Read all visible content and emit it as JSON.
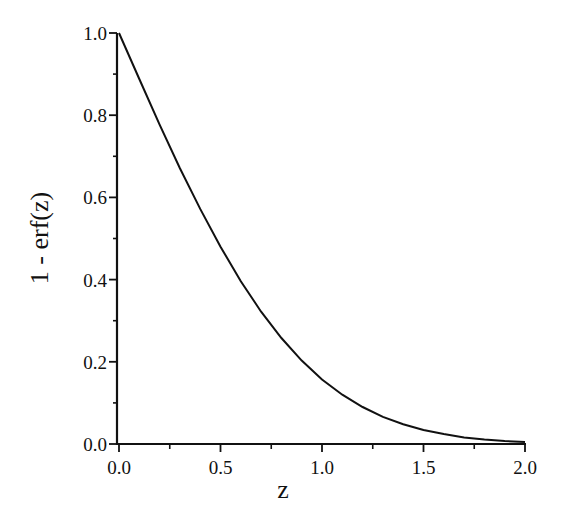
{
  "chart_data": {
    "type": "line",
    "title": "",
    "xlabel": "z",
    "ylabel": "1 - erf(z)",
    "xlim": [
      0.0,
      2.0
    ],
    "ylim": [
      0.0,
      1.0
    ],
    "grid": false,
    "legend": null,
    "x_ticks": [
      "0.0",
      "0.5",
      "1.0",
      "1.5",
      "2.0"
    ],
    "y_ticks": [
      "0.0",
      "0.2",
      "0.4",
      "0.6",
      "0.8",
      "1.0"
    ],
    "series": [
      {
        "name": "1 - erf(z)",
        "x": [
          0.0,
          0.1,
          0.2,
          0.3,
          0.4,
          0.5,
          0.6,
          0.7,
          0.8,
          0.9,
          1.0,
          1.1,
          1.2,
          1.3,
          1.4,
          1.5,
          1.6,
          1.7,
          1.8,
          1.9,
          2.0
        ],
        "y": [
          1.0,
          0.888,
          0.777,
          0.671,
          0.572,
          0.48,
          0.396,
          0.322,
          0.258,
          0.203,
          0.157,
          0.12,
          0.09,
          0.066,
          0.048,
          0.034,
          0.024,
          0.016,
          0.011,
          0.007,
          0.005
        ]
      }
    ]
  },
  "labels": {
    "x_axis": "z",
    "y_axis": "1 - erf(z)"
  }
}
